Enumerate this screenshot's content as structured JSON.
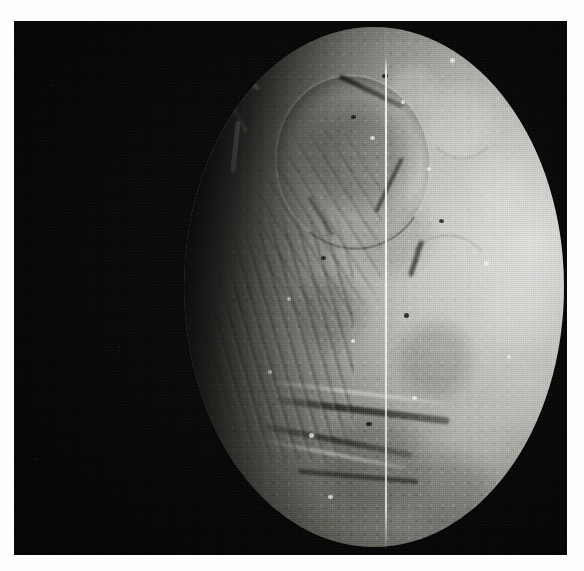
{
  "image": {
    "kind": "astronomical-photograph",
    "subject": "Ariel",
    "subject_type": "icy moon",
    "primary_body": "Uranus",
    "mission": "Voyager 2",
    "color_mode": "grayscale",
    "border_color": "#fdfdfd",
    "sky_color": "#050505",
    "terminator_side": "left",
    "illuminated_limb_side": "right",
    "visible_text": [],
    "alt_text": "Grayscale spacecraft image of a heavily cratered icy moon against black space. The right limb is brightly sunlit while the left side fades into a dark terminator. Networks of deep canyons, grooved ridged terrain and impact craters cross the surface. A thin bright vertical scan-line artifact runs down the disk.",
    "features": [
      {
        "name": "bright-limb",
        "description": "Sunlit eastern limb, highest reflectance region",
        "brightness": "#f2f2f0"
      },
      {
        "name": "terminator",
        "description": "Soft day-night shading boundary on the western side",
        "brightness": "#0a0a08"
      },
      {
        "name": "degraded-crater-ring",
        "description": "Large old impact basin rim in the northern hemisphere"
      },
      {
        "name": "bright-scarp",
        "description": "High-albedo fault scarp near the terminator"
      },
      {
        "name": "canyon-system",
        "description": "Deep graben and rift valleys crossing the southern hemisphere"
      },
      {
        "name": "grooved-terrain",
        "description": "Parallel ridges and troughs along the terminator"
      },
      {
        "name": "scan-line-artifact",
        "description": "Thin bright vertical line from the vidicon camera readout"
      }
    ],
    "geometry": {
      "canvas_width_px": 584,
      "canvas_height_px": 571,
      "plate_left_px": 14,
      "plate_top_px": 21,
      "plate_width_px": 553,
      "plate_height_px": 534,
      "disk_center_x_px": 360,
      "disk_center_y_px": 293,
      "disk_width_px": 380,
      "disk_height_px": 520,
      "scanline_x_px": 385
    }
  }
}
